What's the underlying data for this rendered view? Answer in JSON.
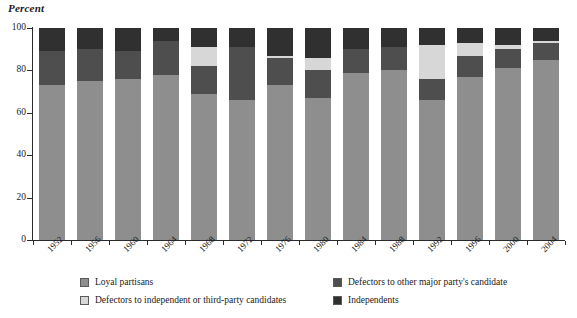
{
  "axis": {
    "y_title": "Percent",
    "y_ticks": [
      0,
      20,
      40,
      60,
      80,
      100
    ]
  },
  "legend": {
    "items": [
      {
        "label": "Loyal partisans",
        "color": "#8e8e8e",
        "key": "loyal"
      },
      {
        "label": "Defectors to other major party's candidate",
        "color": "#4e4e4e",
        "key": "major"
      },
      {
        "label": "Defectors to independent or third-party candidates",
        "color": "#d7d7d7",
        "key": "third"
      },
      {
        "label": "Independents",
        "color": "#303030",
        "key": "indep"
      }
    ]
  },
  "chart_data": {
    "type": "bar",
    "stacked": true,
    "title": "",
    "xlabel": "",
    "ylabel": "Percent",
    "ylim": [
      0,
      100
    ],
    "grid": false,
    "legend_position": "bottom",
    "categories": [
      "1952",
      "1956",
      "1960",
      "1964",
      "1968",
      "1972",
      "1976",
      "1980",
      "1984",
      "1988",
      "1992",
      "1996",
      "2000",
      "2004"
    ],
    "series": [
      {
        "name": "Loyal partisans",
        "color": "#8e8e8e",
        "values": [
          73,
          75,
          76,
          78,
          69,
          66,
          73,
          67,
          79,
          80,
          66,
          77,
          81,
          85
        ]
      },
      {
        "name": "Defectors to other major party's candidate",
        "color": "#4e4e4e",
        "values": [
          16,
          15,
          13,
          16,
          13,
          25,
          13,
          13,
          11,
          11,
          10,
          10,
          9,
          8
        ]
      },
      {
        "name": "Defectors to independent or third-party candidates",
        "color": "#d7d7d7",
        "values": [
          0,
          0,
          0,
          0,
          9,
          0,
          1,
          6,
          0,
          0,
          16,
          6,
          2,
          1
        ]
      },
      {
        "name": "Independents",
        "color": "#303030",
        "values": [
          11,
          10,
          11,
          6,
          9,
          9,
          13,
          14,
          10,
          9,
          8,
          7,
          8,
          6
        ]
      }
    ]
  }
}
